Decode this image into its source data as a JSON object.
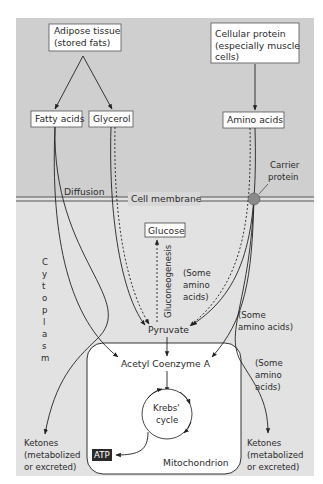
{
  "diagram": {
    "colors": {
      "extracellular_bg": "#cfcfcf",
      "cytoplasm_bg": "#e2e2e2",
      "mitochondrion_bg": "#ffffff",
      "line": "#333333",
      "carrier_protein": "#8a8a8a",
      "atp_bg": "#2a2a2a",
      "atp_text": "#ffffff"
    },
    "sources": {
      "adipose": {
        "line1": "Adipose tissue",
        "line2": "(stored fats)"
      },
      "protein": {
        "line1": "Cellular protein",
        "line2": "(especially muscle",
        "line3": "cells)"
      }
    },
    "products": {
      "fatty_acids": "Fatty acids",
      "glycerol": "Glycerol",
      "amino_acids": "Amino acids"
    },
    "membrane": {
      "label": "Cell membrane",
      "diffusion": "Diffusion",
      "carrier": {
        "line1": "Carrier",
        "line2": "protein"
      }
    },
    "cytoplasm_label": [
      "C",
      "y",
      "t",
      "o",
      "p",
      "l",
      "a",
      "s",
      "m"
    ],
    "glucose": "Glucose",
    "gluconeogenesis": "Gluconeogenesis",
    "some_amino_inner": {
      "line1": "(Some",
      "line2": "amino",
      "line3": "acids)"
    },
    "some_amino_right": {
      "line1": "(Some",
      "line2": "amino acids)"
    },
    "some_amino_mito": {
      "line1": "(Some",
      "line2": "amino",
      "line3": "acids)"
    },
    "pyruvate": "Pyruvate",
    "acetyl_coa": "Acetyl Coenzyme A",
    "krebs": {
      "line1": "Krebs'",
      "line2": "cycle"
    },
    "atp": "ATP",
    "mitochondrion": "Mitochondrion",
    "ketones_left": {
      "line1": "Ketones",
      "line2": "(metabolized",
      "line3": "or excreted)"
    },
    "ketones_right": {
      "line1": "Ketones",
      "line2": "(metabolized",
      "line3": "or excreted)"
    }
  }
}
